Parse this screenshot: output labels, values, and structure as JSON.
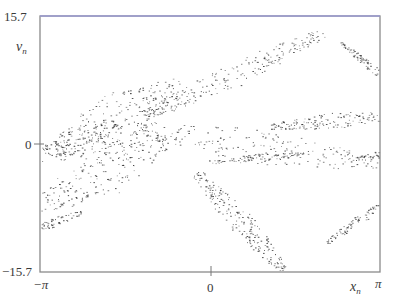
{
  "chart_data": {
    "type": "scatter",
    "title": "",
    "xlabel": "x_n",
    "ylabel": "v_n",
    "xlim": [
      -3.14159,
      3.14159
    ],
    "ylim": [
      -15.7,
      15.7
    ],
    "x_tick_labels": [
      "−π",
      "0",
      "π"
    ],
    "y_tick_labels": [
      "15.7",
      "0",
      "−15.7"
    ],
    "grid": false,
    "legend": null,
    "marker_color": "#2b2b2b",
    "frame_color": "#8a8a8a",
    "frame_top_color": "#9a9ad0",
    "clusters": [
      {
        "name": "left-lattice-A",
        "cx": -2.55,
        "cy": 0.2,
        "len": 0.9,
        "angle": 22,
        "width": 1.6,
        "n": 150,
        "blocky": true
      },
      {
        "name": "left-lattice-B",
        "cx": -1.75,
        "cy": 3.0,
        "len": 1.3,
        "angle": 28,
        "width": 3.2,
        "n": 260,
        "blocky": true
      },
      {
        "name": "left-lattice-C",
        "cx": -1.95,
        "cy": -3.2,
        "len": 1.3,
        "angle": 28,
        "width": 3.0,
        "n": 240,
        "blocky": true
      },
      {
        "name": "upper-center-streak",
        "cx": 0.45,
        "cy": 8.6,
        "len": 1.8,
        "angle": 25,
        "width": 1.6,
        "n": 220,
        "blocky": false
      },
      {
        "name": "center-band",
        "cx": 0.9,
        "cy": -0.3,
        "len": 2.3,
        "angle": -8,
        "width": 2.2,
        "n": 220,
        "blocky": false
      },
      {
        "name": "right-ellipse",
        "cx": 2.3,
        "cy": 2.9,
        "len": 1.2,
        "angle": 5,
        "width": 1.0,
        "n": 180,
        "blocky": false
      },
      {
        "name": "right-edge-upper",
        "cx": 2.95,
        "cy": 9.5,
        "len": 0.7,
        "angle": -40,
        "width": 0.5,
        "n": 110,
        "blocky": false
      },
      {
        "name": "right-edge-mid",
        "cx": 3.0,
        "cy": -1.4,
        "len": 0.3,
        "angle": 10,
        "width": 0.5,
        "n": 50,
        "blocky": false
      },
      {
        "name": "center-low-band",
        "cx": 0.85,
        "cy": -1.7,
        "len": 0.9,
        "angle": 5,
        "width": 0.5,
        "n": 90,
        "blocky": false
      },
      {
        "name": "lower-center-streak",
        "cx": 0.55,
        "cy": -9.5,
        "len": 1.2,
        "angle": -48,
        "width": 1.6,
        "n": 220,
        "blocky": false
      },
      {
        "name": "right-edge-lower",
        "cx": 2.75,
        "cy": -9.3,
        "len": 0.75,
        "angle": 35,
        "width": 0.6,
        "n": 100,
        "blocky": false
      },
      {
        "name": "left-edge-lower",
        "cx": -2.85,
        "cy": -9.5,
        "len": 0.5,
        "angle": 20,
        "width": 0.6,
        "n": 80,
        "blocky": false
      }
    ]
  },
  "labels": {
    "y_max": "15.7",
    "y_zero": "0",
    "y_min": "−15.7",
    "y_axis_var": "v",
    "y_axis_sub": "n",
    "x_min": "−π",
    "x_zero": "0",
    "x_max": "π",
    "x_axis_var": "x",
    "x_axis_sub": "n"
  }
}
